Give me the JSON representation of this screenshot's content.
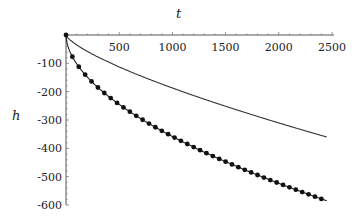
{
  "chart_data": {
    "type": "line",
    "title": "",
    "xlabel": "t",
    "ylabel": "h",
    "xlim": [
      0,
      2500
    ],
    "ylim": [
      -600,
      0
    ],
    "x_ticks": [
      500,
      1000,
      1500,
      2000,
      2500
    ],
    "x_tick_labels": [
      "500",
      "1000",
      "1500",
      "2000",
      "2500"
    ],
    "y_ticks": [
      -100,
      -200,
      -300,
      -400,
      -500,
      -600
    ],
    "y_tick_labels": [
      "-100",
      "-200",
      "-300",
      "-400",
      "-500",
      "-600"
    ],
    "grid": false,
    "legend": null,
    "series": [
      {
        "name": "upper curve (solid line)",
        "style": "line",
        "x": [
          0,
          100,
          250,
          500,
          750,
          1000,
          1250,
          1500,
          1750,
          2000,
          2250,
          2450
        ],
        "y": [
          0,
          -55,
          -90,
          -130,
          -160,
          -187,
          -215,
          -245,
          -275,
          -305,
          -335,
          -360
        ]
      },
      {
        "name": "lower curve (line with dot markers)",
        "style": "line+markers",
        "x": [
          0,
          100,
          250,
          500,
          750,
          1000,
          1250,
          1500,
          1750,
          2000,
          2250,
          2450
        ],
        "y": [
          0,
          -90,
          -165,
          -245,
          -305,
          -355,
          -400,
          -440,
          -480,
          -515,
          -550,
          -585
        ]
      }
    ]
  },
  "axes": {
    "x_label": "t",
    "y_label": "h",
    "x_ticks": [
      "500",
      "1000",
      "1500",
      "2000",
      "2500"
    ],
    "y_ticks": [
      "-100",
      "-200",
      "-300",
      "-400",
      "-500",
      "-600"
    ]
  }
}
